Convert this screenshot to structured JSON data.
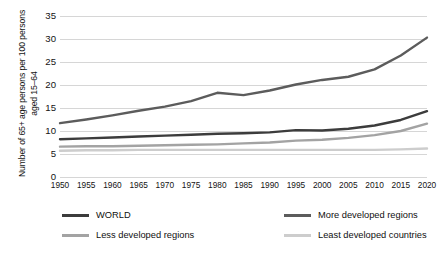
{
  "chart_data": {
    "type": "line",
    "title": "",
    "xlabel": "",
    "ylabel": "Number of 65+ age persons per 100 persons aged 15–64",
    "categories": [
      "1950",
      "1955",
      "1960",
      "1965",
      "1970",
      "1975",
      "1980",
      "1985",
      "1990",
      "1995",
      "2000",
      "2005",
      "2010",
      "2015",
      "2020"
    ],
    "ylim": [
      0,
      35
    ],
    "ytick_labels": [
      "0",
      "5",
      "10",
      "15",
      "20",
      "25",
      "30",
      "35"
    ],
    "yticks": [
      0,
      5,
      10,
      15,
      20,
      25,
      30,
      35
    ],
    "grid": true,
    "legend_position": "bottom",
    "series": [
      {
        "name": "WORLD",
        "color": "#3c3c3c",
        "values": [
          8.2,
          8.4,
          8.6,
          8.8,
          9.0,
          9.2,
          9.4,
          9.5,
          9.7,
          10.2,
          10.1,
          10.5,
          11.2,
          12.4,
          14.3
        ]
      },
      {
        "name": "More developed regions",
        "color": "#5c5c5c",
        "values": [
          11.7,
          12.5,
          13.4,
          14.4,
          15.3,
          16.5,
          18.3,
          17.8,
          18.8,
          20.1,
          21.1,
          21.8,
          23.4,
          26.4,
          30.3
        ]
      },
      {
        "name": "Less developed regions",
        "color": "#a3a3a3",
        "values": [
          6.6,
          6.7,
          6.7,
          6.8,
          6.9,
          7.0,
          7.1,
          7.3,
          7.5,
          7.9,
          8.1,
          8.5,
          9.1,
          10.0,
          11.6
        ]
      },
      {
        "name": "Least developed countries",
        "color": "#cdcdcd",
        "values": [
          5.7,
          5.8,
          5.8,
          5.9,
          5.9,
          5.9,
          5.9,
          5.9,
          5.9,
          5.9,
          5.9,
          5.9,
          5.9,
          6.0,
          6.2
        ]
      }
    ]
  },
  "legend": {
    "items": [
      {
        "label": "WORLD",
        "color": "#3c3c3c"
      },
      {
        "label": "More developed regions",
        "color": "#5c5c5c"
      },
      {
        "label": "Less developed regions",
        "color": "#a3a3a3"
      },
      {
        "label": "Least developed countries",
        "color": "#cdcdcd"
      }
    ]
  }
}
